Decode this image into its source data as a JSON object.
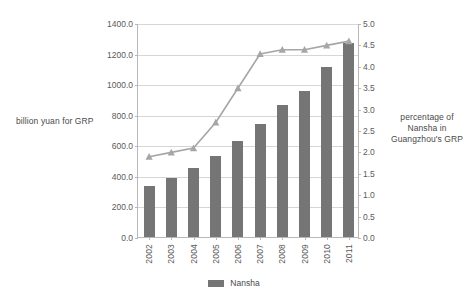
{
  "chart_data": {
    "type": "bar",
    "title": "",
    "categories": [
      "2002",
      "2003",
      "2004",
      "2005",
      "2006",
      "2007",
      "2008",
      "2009",
      "2010",
      "2011"
    ],
    "xlabel": "",
    "ylabel": "billion yuan for GRP",
    "y2label": "percentage of Nansha in Guangzhou's GRP",
    "ylim": [
      0,
      1400
    ],
    "y2lim": [
      0,
      5
    ],
    "yticks": [
      "0.0",
      "200.0",
      "400.0",
      "600.0",
      "800.0",
      "1000.0",
      "1200.0",
      "1400.0"
    ],
    "ytick_values": [
      0,
      200,
      400,
      600,
      800,
      1000,
      1200,
      1400
    ],
    "y2ticks": [
      "0.0",
      "0.5",
      "1.0",
      "1.5",
      "2.0",
      "2.5",
      "3.0",
      "3.5",
      "4.0",
      "4.5",
      "5.0"
    ],
    "y2tick_values": [
      0,
      0.5,
      1.0,
      1.5,
      2.0,
      2.5,
      3.0,
      3.5,
      4.0,
      4.5,
      5.0
    ],
    "grid": true,
    "legend_position": "bottom",
    "series": [
      {
        "name": "Nansha",
        "type": "bar",
        "axis": "left",
        "color": "#757575",
        "values": [
          333,
          384,
          451,
          528,
          628,
          742,
          865,
          952,
          1112,
          1270
        ]
      },
      {
        "name": "percentage of Nansha in Guangzhou's GRP",
        "type": "line",
        "axis": "right",
        "color": "#a6a6a6",
        "marker": "triangle",
        "values": [
          1.9,
          2.0,
          2.1,
          2.7,
          3.5,
          4.3,
          4.4,
          4.4,
          4.5,
          4.6
        ]
      }
    ]
  },
  "legend": {
    "items": [
      {
        "label": "Nansha",
        "color": "#757575"
      }
    ]
  },
  "axis_titles": {
    "left": "billion yuan for GRP",
    "right_line1": "percentage of",
    "right_line2": "Nansha in",
    "right_line3": "Guangzhou's GRP"
  },
  "colors": {
    "bar": "#757575",
    "line": "#a6a6a6",
    "grid": "#d6d6d6",
    "axis": "#b8b8b8",
    "text": "#5a5a5a",
    "background": "#ffffff"
  }
}
